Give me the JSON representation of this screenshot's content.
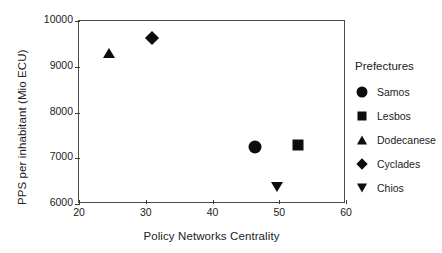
{
  "chart_data": {
    "type": "scatter",
    "title": "",
    "xlabel": "Policy Networks Centrality",
    "ylabel": "PPS per inhabitant (Mio ECU)",
    "xlim": [
      20,
      60
    ],
    "ylim": [
      6000,
      10000
    ],
    "xticks": [
      "20",
      "30",
      "40",
      "50",
      "60"
    ],
    "yticks": [
      "6000",
      "7000",
      "8000",
      "9000",
      "10000"
    ],
    "grid": false,
    "legend_position": "right",
    "legend_title": "Prefectures",
    "series": [
      {
        "name": "Samos",
        "marker": "circle",
        "x": 46.4,
        "y": 7250
      },
      {
        "name": "Lesbos",
        "marker": "square",
        "x": 52.8,
        "y": 7280
      },
      {
        "name": "Dodecanese",
        "marker": "triangle-up",
        "x": 24.5,
        "y": 9300
      },
      {
        "name": "Cyclades",
        "marker": "diamond",
        "x": 31.0,
        "y": 9620
      },
      {
        "name": "Chios",
        "marker": "triangle-down",
        "x": 49.7,
        "y": 6380
      }
    ]
  },
  "colors": {
    "marker": "#0d0d0d",
    "axis": "#4a4a4a",
    "text": "#222222",
    "background": "#ffffff"
  }
}
